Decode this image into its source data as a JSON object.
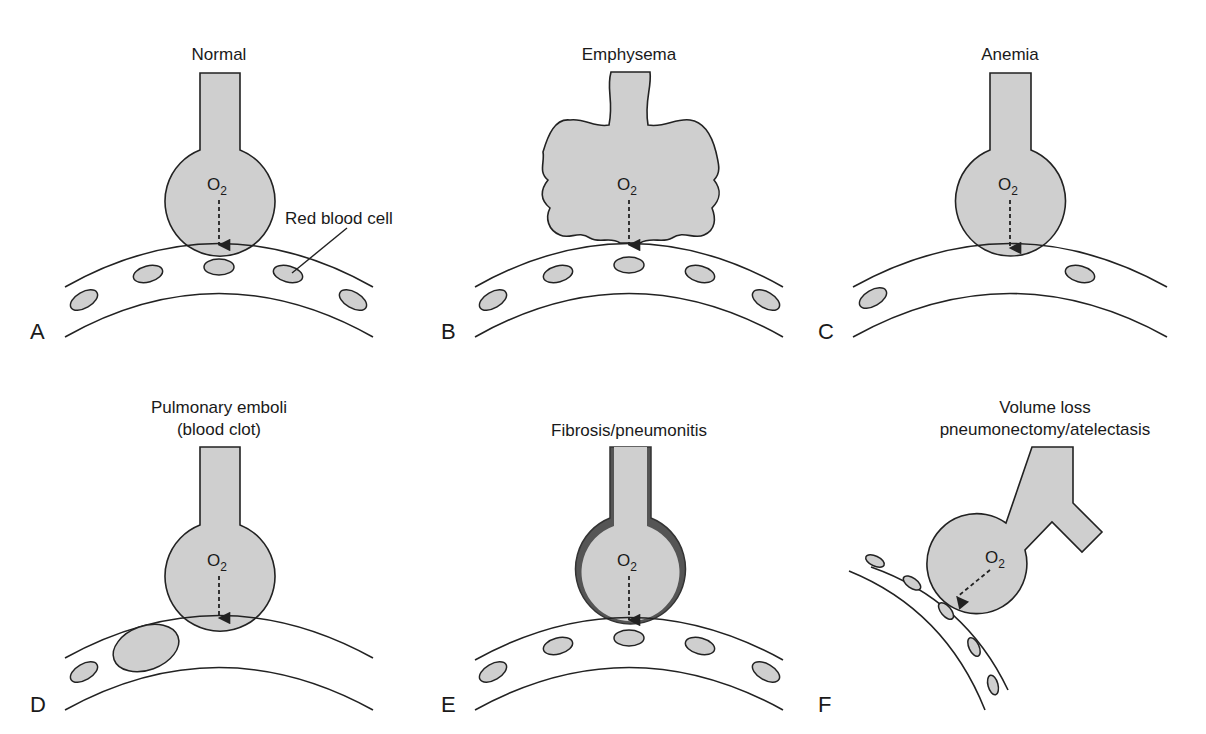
{
  "figure": {
    "panels": [
      {
        "letter": "A",
        "title_lines": [
          "Normal"
        ],
        "gas": "O",
        "gas_sub": "2",
        "rbc_count": 5
      },
      {
        "letter": "B",
        "title_lines": [
          "Emphysema"
        ],
        "gas": "O",
        "gas_sub": "2",
        "rbc_count": 5
      },
      {
        "letter": "C",
        "title_lines": [
          "Anemia"
        ],
        "gas": "O",
        "gas_sub": "2",
        "rbc_count": 2
      },
      {
        "letter": "D",
        "title_lines": [
          "Pulmonary emboli",
          "(blood clot)"
        ],
        "gas": "O",
        "gas_sub": "2",
        "rbc_count": 1
      },
      {
        "letter": "E",
        "title_lines": [
          "Fibrosis/pneumonitis"
        ],
        "gas": "O",
        "gas_sub": "2",
        "rbc_count": 5
      },
      {
        "letter": "F",
        "title_lines": [
          "Volume loss",
          "pneumonectomy/atelectasis"
        ],
        "gas": "O",
        "gas_sub": "2",
        "rbc_count": 5
      }
    ],
    "annotation": "Red blood cell",
    "colors": {
      "fill": "#cfcfcf",
      "stroke": "#222222",
      "fibrosis_wall": "#555555"
    }
  }
}
